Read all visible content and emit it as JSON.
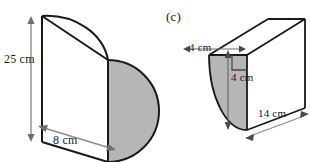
{
  "figure_left": {
    "name": "half-cylinder-prism",
    "shaded_face": "semicircle",
    "labels": {
      "height": "25 cm",
      "depth": "8 cm"
    }
  },
  "figure_c": {
    "name": "quarter-cylinder-prism",
    "tag": "(c)",
    "shaded_face": "quarter-circle",
    "right_angle_marker": true,
    "labels": {
      "radius_horizontal": "4 cm",
      "radius_vertical": "4 cm",
      "length": "14 cm"
    }
  },
  "style": {
    "fill_gray": "#b6b6b6",
    "outline": "#1a1a1a",
    "dimension_line": "#8c8c8c",
    "background": "#ffffff"
  }
}
